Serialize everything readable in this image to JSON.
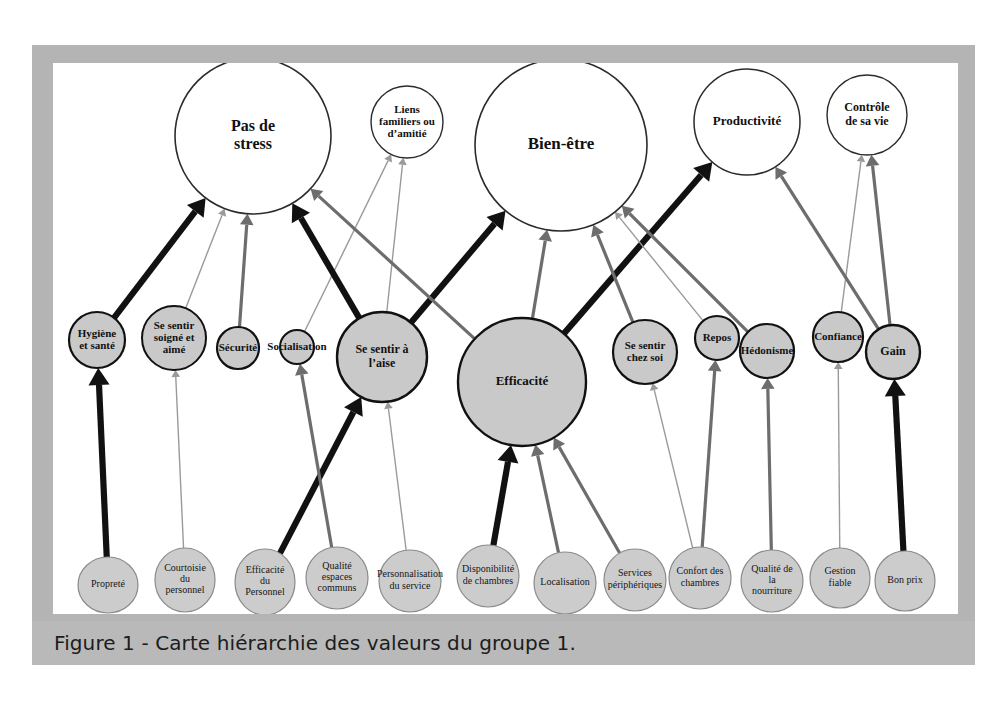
{
  "figure": {
    "caption": "Figure 1 - Carte hiérarchie des valeurs du groupe 1.",
    "frame_color": "#b4b4b4",
    "caption_bar_color": "#b9b9b9",
    "canvas_color": "#ffffff"
  },
  "chart_data": {
    "type": "diagram",
    "subtype": "hierarchical-value-map",
    "title": "Carte hiérarchie des valeurs du groupe 1",
    "levels": [
      "attributs",
      "consequences",
      "valeurs"
    ],
    "link_weights": {
      "thin": "#9a9a9a",
      "medium": "#6d6d6d",
      "thick": "#111111"
    },
    "values": [
      {
        "id": "pas_de_stress",
        "label": "Pas de\nstress",
        "cx": 253,
        "cy": 136,
        "r": 78,
        "fill": "#ffffff",
        "stroke": "#2b2b2b",
        "sw": 1.6,
        "fs": 16
      },
      {
        "id": "liens_familiers",
        "label": "Liens\nfamiliers ou\nd’amitié",
        "cx": 407,
        "cy": 122,
        "r": 36,
        "fill": "#ffffff",
        "stroke": "#2b2b2b",
        "sw": 1.4,
        "fs": 11
      },
      {
        "id": "bien_etre",
        "label": "Bien-être",
        "cx": 561,
        "cy": 145,
        "r": 86,
        "fill": "#ffffff",
        "stroke": "#2b2b2b",
        "sw": 1.6,
        "fs": 17
      },
      {
        "id": "productivite",
        "label": "Productivité",
        "cx": 747,
        "cy": 122,
        "r": 53,
        "fill": "#ffffff",
        "stroke": "#2b2b2b",
        "sw": 1.5,
        "fs": 13
      },
      {
        "id": "controle_vie",
        "label": "Contrôle\nde sa vie",
        "cx": 867,
        "cy": 115,
        "r": 40,
        "fill": "#ffffff",
        "stroke": "#2b2b2b",
        "sw": 1.4,
        "fs": 12
      }
    ],
    "consequences": [
      {
        "id": "hygiene_sante",
        "label": "Hygiène\net santé",
        "cx": 97,
        "cy": 340,
        "r": 28,
        "fill": "#c9c9c9",
        "stroke": "#111111",
        "sw": 2.2,
        "fs": 11
      },
      {
        "id": "soigne_aime",
        "label": "Se sentir\nsoigné et\naimé",
        "cx": 174,
        "cy": 338,
        "r": 32,
        "fill": "#c9c9c9",
        "stroke": "#111111",
        "sw": 2.0,
        "fs": 11
      },
      {
        "id": "securite",
        "label": "Sécurité",
        "cx": 238,
        "cy": 348,
        "r": 21,
        "fill": "#c9c9c9",
        "stroke": "#111111",
        "sw": 2.2,
        "fs": 11
      },
      {
        "id": "socialisation",
        "label": "Socialisation",
        "cx": 297,
        "cy": 347,
        "r": 17,
        "fill": "#c9c9c9",
        "stroke": "#111111",
        "sw": 2.0,
        "fs": 11
      },
      {
        "id": "se_sentir_aise",
        "label": "Se sentir à\nl’aise",
        "cx": 382,
        "cy": 357,
        "r": 45,
        "fill": "#c9c9c9",
        "stroke": "#111111",
        "sw": 2.4,
        "fs": 12
      },
      {
        "id": "efficacite",
        "label": "Efficacité",
        "cx": 522,
        "cy": 382,
        "r": 64,
        "fill": "#c9c9c9",
        "stroke": "#111111",
        "sw": 2.4,
        "fs": 13
      },
      {
        "id": "chez_soi",
        "label": "Se sentir\nchez soi",
        "cx": 645,
        "cy": 352,
        "r": 32,
        "fill": "#c9c9c9",
        "stroke": "#111111",
        "sw": 2.2,
        "fs": 11
      },
      {
        "id": "repos",
        "label": "Repos",
        "cx": 717,
        "cy": 338,
        "r": 22,
        "fill": "#c9c9c9",
        "stroke": "#111111",
        "sw": 2.2,
        "fs": 11
      },
      {
        "id": "hedonisme",
        "label": "Hédonisme",
        "cx": 767,
        "cy": 351,
        "r": 27,
        "fill": "#c9c9c9",
        "stroke": "#111111",
        "sw": 2.2,
        "fs": 11
      },
      {
        "id": "confiance",
        "label": "Confiance",
        "cx": 838,
        "cy": 337,
        "r": 25,
        "fill": "#c9c9c9",
        "stroke": "#111111",
        "sw": 2.2,
        "fs": 11
      },
      {
        "id": "gain",
        "label": "Gain",
        "cx": 893,
        "cy": 352,
        "r": 27,
        "fill": "#c9c9c9",
        "stroke": "#111111",
        "sw": 2.4,
        "fs": 12
      }
    ],
    "attributes": [
      {
        "id": "proprete",
        "label": "Propreté",
        "cx": 108,
        "cy": 585,
        "rx": 30,
        "ry": 28,
        "fill": "#cccccc",
        "stroke": "#8a8a8a",
        "fs": 10
      },
      {
        "id": "courtoisie",
        "label": "Courtoisie\ndu\npersonnel",
        "cx": 185,
        "cy": 580,
        "rx": 30,
        "ry": 32,
        "fill": "#cccccc",
        "stroke": "#8a8a8a",
        "fs": 10
      },
      {
        "id": "efficacite_personnel",
        "label": "Efficacité\ndu\nPersonnel",
        "cx": 265,
        "cy": 582,
        "rx": 30,
        "ry": 33,
        "fill": "#cccccc",
        "stroke": "#8a8a8a",
        "fs": 10
      },
      {
        "id": "qualite_espaces",
        "label": "Qualité\nespaces\ncommuns",
        "cx": 337,
        "cy": 578,
        "rx": 31,
        "ry": 31,
        "fill": "#cccccc",
        "stroke": "#8a8a8a",
        "fs": 10
      },
      {
        "id": "personnalisation",
        "label": "Personnalisation\ndu service",
        "cx": 410,
        "cy": 581,
        "rx": 31,
        "ry": 31,
        "fill": "#cccccc",
        "stroke": "#8a8a8a",
        "fs": 10
      },
      {
        "id": "disponibilite",
        "label": "Disponibilité\nde chambres",
        "cx": 488,
        "cy": 576,
        "rx": 31,
        "ry": 31,
        "fill": "#cccccc",
        "stroke": "#8a8a8a",
        "fs": 10
      },
      {
        "id": "localisation",
        "label": "Localisation",
        "cx": 565,
        "cy": 583,
        "rx": 31,
        "ry": 31,
        "fill": "#cccccc",
        "stroke": "#8a8a8a",
        "fs": 10
      },
      {
        "id": "services_periph",
        "label": "Services\npériphériques",
        "cx": 635,
        "cy": 580,
        "rx": 31,
        "ry": 31,
        "fill": "#cccccc",
        "stroke": "#8a8a8a",
        "fs": 10
      },
      {
        "id": "confort_chambres",
        "label": "Confort des\nchambres",
        "cx": 700,
        "cy": 578,
        "rx": 31,
        "ry": 31,
        "fill": "#cccccc",
        "stroke": "#8a8a8a",
        "fs": 10
      },
      {
        "id": "qualite_nourriture",
        "label": "Qualité de\nla\nnourriture",
        "cx": 772,
        "cy": 581,
        "rx": 31,
        "ry": 31,
        "fill": "#cccccc",
        "stroke": "#8a8a8a",
        "fs": 10
      },
      {
        "id": "gestion_fiable",
        "label": "Gestion\nfiable",
        "cx": 840,
        "cy": 578,
        "rx": 30,
        "ry": 30,
        "fill": "#cccccc",
        "stroke": "#8a8a8a",
        "fs": 10
      },
      {
        "id": "bon_prix",
        "label": "Bon prix",
        "cx": 905,
        "cy": 581,
        "rx": 30,
        "ry": 30,
        "fill": "#cccccc",
        "stroke": "#8a8a8a",
        "fs": 10
      }
    ],
    "links": [
      {
        "from": "proprete",
        "to": "hygiene_sante",
        "weight": "thick"
      },
      {
        "from": "courtoisie",
        "to": "soigne_aime",
        "weight": "thin"
      },
      {
        "from": "efficacite_personnel",
        "to": "se_sentir_aise",
        "weight": "thick"
      },
      {
        "from": "qualite_espaces",
        "to": "socialisation",
        "weight": "medium"
      },
      {
        "from": "personnalisation",
        "to": "se_sentir_aise",
        "weight": "thin"
      },
      {
        "from": "disponibilite",
        "to": "efficacite",
        "weight": "thick"
      },
      {
        "from": "localisation",
        "to": "efficacite",
        "weight": "medium"
      },
      {
        "from": "services_periph",
        "to": "efficacite",
        "weight": "medium"
      },
      {
        "from": "confort_chambres",
        "to": "chez_soi",
        "weight": "thin"
      },
      {
        "from": "confort_chambres",
        "to": "repos",
        "weight": "medium"
      },
      {
        "from": "qualite_nourriture",
        "to": "hedonisme",
        "weight": "medium"
      },
      {
        "from": "gestion_fiable",
        "to": "confiance",
        "weight": "thin"
      },
      {
        "from": "bon_prix",
        "to": "gain",
        "weight": "thick"
      },
      {
        "from": "hygiene_sante",
        "to": "pas_de_stress",
        "weight": "thick"
      },
      {
        "from": "soigne_aime",
        "to": "pas_de_stress",
        "weight": "thin"
      },
      {
        "from": "securite",
        "to": "pas_de_stress",
        "weight": "medium"
      },
      {
        "from": "socialisation",
        "to": "liens_familiers",
        "weight": "thin"
      },
      {
        "from": "se_sentir_aise",
        "to": "pas_de_stress",
        "weight": "thick"
      },
      {
        "from": "se_sentir_aise",
        "to": "bien_etre",
        "weight": "thick"
      },
      {
        "from": "se_sentir_aise",
        "to": "liens_familiers",
        "weight": "thin"
      },
      {
        "from": "efficacite",
        "to": "productivite",
        "weight": "thick"
      },
      {
        "from": "efficacite",
        "to": "bien_etre",
        "weight": "medium"
      },
      {
        "from": "efficacite",
        "to": "pas_de_stress",
        "weight": "medium"
      },
      {
        "from": "chez_soi",
        "to": "bien_etre",
        "weight": "medium"
      },
      {
        "from": "repos",
        "to": "bien_etre",
        "weight": "thin"
      },
      {
        "from": "hedonisme",
        "to": "bien_etre",
        "weight": "medium"
      },
      {
        "from": "confiance",
        "to": "controle_vie",
        "weight": "thin"
      },
      {
        "from": "gain",
        "to": "controle_vie",
        "weight": "medium"
      },
      {
        "from": "gain",
        "to": "productivite",
        "weight": "medium"
      }
    ]
  }
}
